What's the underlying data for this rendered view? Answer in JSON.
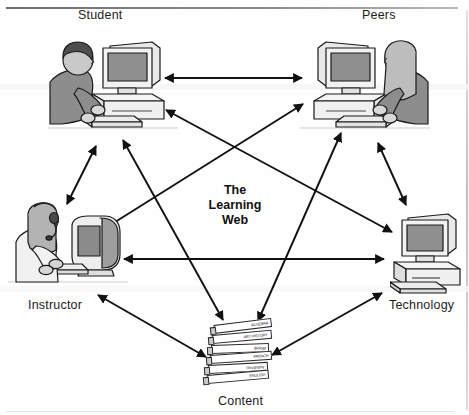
{
  "figure": {
    "title": "The Learning Web",
    "center_label_lines": [
      "The",
      "Learning",
      "Web"
    ]
  },
  "nodes": [
    {
      "id": "student",
      "label": "Student",
      "icon": "person-at-desktop-computer-icon"
    },
    {
      "id": "peers",
      "label": "Peers",
      "icon": "person-at-desktop-computer-icon"
    },
    {
      "id": "instructor",
      "label": "Instructor",
      "icon": "person-with-headset-at-imac-icon"
    },
    {
      "id": "technology",
      "label": "Technology",
      "icon": "desktop-computer-icon"
    },
    {
      "id": "content",
      "label": "Content",
      "icon": "stack-of-books-icon"
    }
  ],
  "books": [
    {
      "title": "ALGEBRA"
    },
    {
      "title": "ART HISTORY"
    },
    {
      "title": "Biology"
    },
    {
      "title": "FRENCH"
    },
    {
      "title": "Geography"
    },
    {
      "title": "ENGLISH"
    }
  ],
  "connections": [
    {
      "from": "student",
      "to": "peers",
      "style": "double-arrow"
    },
    {
      "from": "student",
      "to": "instructor",
      "style": "double-arrow"
    },
    {
      "from": "student",
      "to": "technology",
      "style": "double-arrow"
    },
    {
      "from": "student",
      "to": "content",
      "style": "double-arrow"
    },
    {
      "from": "peers",
      "to": "instructor",
      "style": "double-arrow"
    },
    {
      "from": "peers",
      "to": "technology",
      "style": "double-arrow"
    },
    {
      "from": "peers",
      "to": "content",
      "style": "double-arrow"
    },
    {
      "from": "instructor",
      "to": "technology",
      "style": "double-arrow"
    },
    {
      "from": "instructor",
      "to": "content",
      "style": "double-arrow"
    },
    {
      "from": "technology",
      "to": "content",
      "style": "double-arrow"
    }
  ],
  "colors": {
    "line": "#111111",
    "text": "#1b1b1b",
    "figure_fill": "#9a9a9a",
    "screen_fill": "#8f8f8f",
    "case_fill": "#efefef"
  }
}
